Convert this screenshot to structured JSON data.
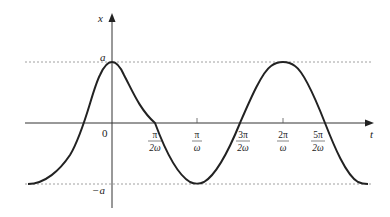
{
  "diagram": {
    "type": "cosine-wave",
    "axes": {
      "x_label": "t",
      "y_label": "x",
      "origin_label": "0"
    },
    "amplitude_labels": {
      "top": "a",
      "bottom": "−a"
    },
    "ticks": [
      {
        "num": "π",
        "den": "2ω",
        "px": 155
      },
      {
        "num": "π",
        "den": "ω",
        "px": 197
      },
      {
        "num": "3π",
        "den": "2ω",
        "px": 240
      },
      {
        "num": "2π",
        "den": "ω",
        "px": 283
      },
      {
        "num": "5π",
        "den": "2ω",
        "px": 325
      }
    ],
    "function": "x = a cos(ωt)",
    "colors": {
      "curve": "#222222",
      "axis": "#333333",
      "dashed": "#888888"
    }
  }
}
